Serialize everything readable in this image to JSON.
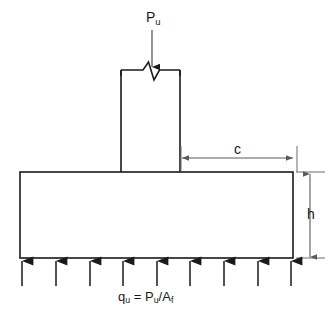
{
  "figure": {
    "type": "structural-engineering-diagram",
    "width": 329,
    "height": 314,
    "background_color": "#ffffff",
    "line_color": "#1a1a1a"
  },
  "labels": {
    "applied_load": "P",
    "applied_load_sub": "u",
    "cantilever_dimension": "c",
    "footing_thickness": "h",
    "soil_pressure_q": "q",
    "soil_pressure_q_sub": "u",
    "soil_pressure_equals": " = ",
    "soil_pressure_p": "P",
    "soil_pressure_p_sub": "u",
    "soil_pressure_slash": "/A",
    "soil_pressure_a_sub": "f"
  },
  "geometry": {
    "footing": {
      "left": 20,
      "right": 293,
      "top": 172,
      "bottom": 258,
      "width": 273,
      "height": 86
    },
    "column": {
      "left": 121,
      "right": 180,
      "top": 70,
      "bottom": 172,
      "width": 59
    },
    "load_arrow": {
      "x": 152,
      "y_start": 30,
      "y_end": 68,
      "direction": "down"
    },
    "break_symbol": {
      "y": 70,
      "center_x": 150,
      "style": "zigzag-v"
    },
    "c_dimension": {
      "y": 158,
      "x_start": 181,
      "x_end": 293,
      "arrows": "both"
    },
    "h_dimension": {
      "x": 310,
      "y_start": 174,
      "y_end": 258,
      "arrows": "both"
    },
    "soil_pressure_arrows": {
      "count": 9,
      "y_tail": 285,
      "y_tip": 259,
      "direction": "up",
      "x_positions": [
        22,
        56,
        90,
        123,
        157,
        190,
        224,
        258,
        291
      ]
    }
  }
}
